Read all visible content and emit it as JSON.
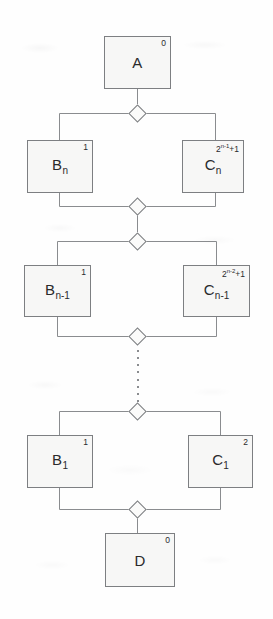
{
  "diagram": {
    "style": {
      "node_fill": "#f7f7f6",
      "node_stroke": "#7d7f82",
      "edge_stroke": "#8a8c8f",
      "text_color": "#2a2a2c",
      "background": "#fefefe"
    },
    "nodes": [
      {
        "id": "A",
        "label": "A",
        "sub": "",
        "multiplicity": "0",
        "mult_base": "0",
        "mult_exp": ""
      },
      {
        "id": "Bn",
        "label": "B",
        "sub": "n",
        "multiplicity": "1",
        "mult_base": "1",
        "mult_exp": ""
      },
      {
        "id": "Cn",
        "label": "C",
        "sub": "n",
        "multiplicity": "2n-1+1",
        "mult_base": "2",
        "mult_exp": "n-1",
        "mult_suffix": "+1"
      },
      {
        "id": "Bn1",
        "label": "B",
        "sub": "n-1",
        "multiplicity": "1",
        "mult_base": "1",
        "mult_exp": ""
      },
      {
        "id": "Cn1",
        "label": "C",
        "sub": "n-1",
        "multiplicity": "2n-2+1",
        "mult_base": "2",
        "mult_exp": "n-2",
        "mult_suffix": "+1"
      },
      {
        "id": "B1",
        "label": "B",
        "sub": "1",
        "multiplicity": "1",
        "mult_base": "1",
        "mult_exp": ""
      },
      {
        "id": "C1",
        "label": "C",
        "sub": "1",
        "multiplicity": "2",
        "mult_base": "2",
        "mult_exp": ""
      },
      {
        "id": "D",
        "label": "D",
        "sub": "",
        "multiplicity": "0",
        "mult_base": "0",
        "mult_exp": ""
      }
    ],
    "junctions": [
      {
        "id": "j1",
        "name": "junction-below-a"
      },
      {
        "id": "j2",
        "name": "junction-below-bn-cn"
      },
      {
        "id": "j3",
        "name": "junction-above-bn1-cn1"
      },
      {
        "id": "j4",
        "name": "junction-below-bn1-cn1"
      },
      {
        "id": "j5",
        "name": "junction-above-b1-c1"
      },
      {
        "id": "j6",
        "name": "junction-below-b1-c1"
      }
    ],
    "ellipsis": "vertical-dotted-continuation"
  }
}
